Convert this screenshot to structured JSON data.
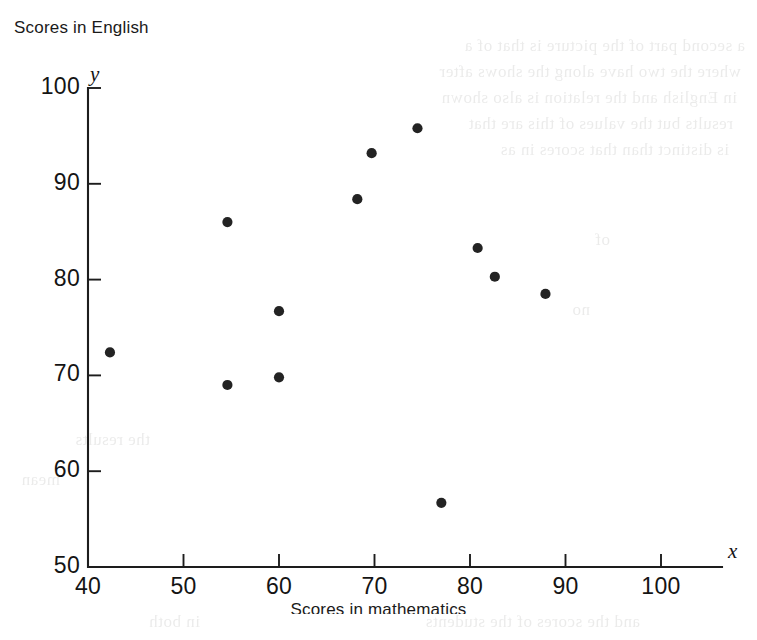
{
  "figure": {
    "y_axis_title": "Scores in English",
    "x_axis_title": "Scores in mathematics",
    "x_var_label": "x",
    "y_var_label": "y"
  },
  "ghost_text": {
    "lines": [
      "a second part of the picture is that of a",
      "where the two have along the shows after",
      "in English and the relation is also shown",
      "results but the values of this are that",
      "is distinct than that scores in as"
    ]
  },
  "chart_data": {
    "type": "scatter",
    "title": "",
    "xlabel": "Scores in mathematics",
    "ylabel": "Scores in English",
    "xlim": [
      40,
      106
    ],
    "ylim": [
      50,
      101
    ],
    "xticks": [
      40,
      50,
      60,
      70,
      80,
      90,
      100
    ],
    "yticks": [
      50,
      60,
      70,
      80,
      90,
      100
    ],
    "grid": false,
    "legend": "none",
    "marker": "filled-circle",
    "marker_color": "#232323",
    "points": [
      {
        "x": 42.3,
        "y": 72.4
      },
      {
        "x": 54.6,
        "y": 86.0
      },
      {
        "x": 54.6,
        "y": 69.0
      },
      {
        "x": 60.0,
        "y": 76.7
      },
      {
        "x": 60.0,
        "y": 69.8
      },
      {
        "x": 68.2,
        "y": 88.4
      },
      {
        "x": 69.7,
        "y": 93.2
      },
      {
        "x": 74.5,
        "y": 95.8
      },
      {
        "x": 77.0,
        "y": 56.7
      },
      {
        "x": 80.8,
        "y": 83.3
      },
      {
        "x": 82.6,
        "y": 80.3
      },
      {
        "x": 87.9,
        "y": 78.5
      }
    ]
  }
}
